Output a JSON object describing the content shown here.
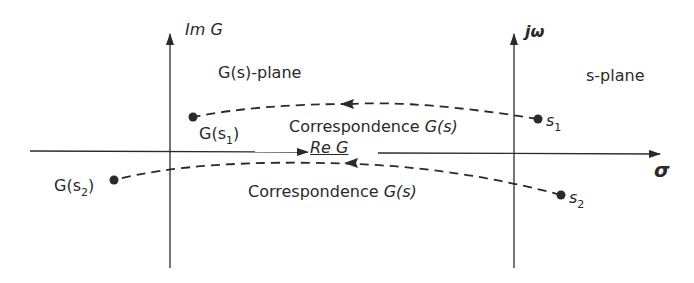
{
  "figure": {
    "left_plane": {
      "title": "G(s)-plane",
      "imag_axis_label": "Im G",
      "real_axis_label": "Re G",
      "points": [
        {
          "label_main": "G(s",
          "label_sub": "1",
          "label_close": ")"
        },
        {
          "label_main": "G(s",
          "label_sub": "2",
          "label_close": ")"
        }
      ]
    },
    "right_plane": {
      "title": "s-plane",
      "imag_axis_label": "jω",
      "real_axis_label": "σ",
      "points": [
        {
          "label_main": "s",
          "label_sub": "1"
        },
        {
          "label_main": "s",
          "label_sub": "2"
        }
      ]
    },
    "mappings": [
      {
        "label_text": "Correspondence ",
        "label_fn": "G(s)",
        "from": "s1",
        "to": "G(s1)"
      },
      {
        "label_text": "Correspondence ",
        "label_fn": "G(s)",
        "from": "s2",
        "to": "G(s2)"
      }
    ],
    "colors": {
      "ink": "#2a2a2a",
      "background": "#ffffff"
    }
  }
}
